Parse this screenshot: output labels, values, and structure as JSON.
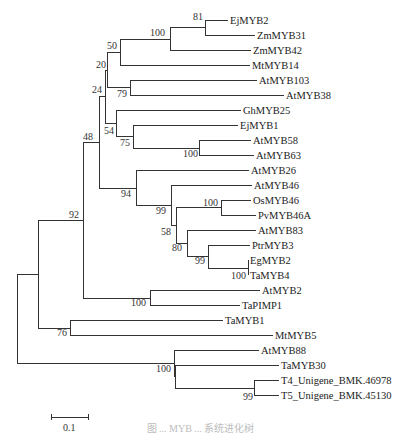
{
  "tree": {
    "type": "phylogenetic-tree",
    "leaves": [
      {
        "label": "EjMYB2",
        "x": 230,
        "y": 20
      },
      {
        "label": "ZmMYB31",
        "x": 257,
        "y": 35
      },
      {
        "label": "ZmMYB42",
        "x": 253,
        "y": 50
      },
      {
        "label": "MtMYB14",
        "x": 252,
        "y": 65
      },
      {
        "label": "AtMYB103",
        "x": 259,
        "y": 80
      },
      {
        "label": "AtMYB38",
        "x": 286,
        "y": 95
      },
      {
        "label": "GhMYB25",
        "x": 243,
        "y": 110
      },
      {
        "label": "EjMYB1",
        "x": 240,
        "y": 125
      },
      {
        "label": "AtMYB58",
        "x": 253,
        "y": 140
      },
      {
        "label": "AtMYB63",
        "x": 256,
        "y": 155
      },
      {
        "label": "AtMYB26",
        "x": 251,
        "y": 170
      },
      {
        "label": "AtMYB46",
        "x": 254,
        "y": 185
      },
      {
        "label": "OsMYB46",
        "x": 253,
        "y": 200
      },
      {
        "label": "PvMYB46A",
        "x": 258,
        "y": 215
      },
      {
        "label": "AtMYB83",
        "x": 258,
        "y": 230
      },
      {
        "label": "PtrMYB3",
        "x": 252,
        "y": 245
      },
      {
        "label": "EgMYB2",
        "x": 250,
        "y": 260
      },
      {
        "label": "TaMYB4",
        "x": 250,
        "y": 275
      },
      {
        "label": "AtMYB2",
        "x": 262,
        "y": 290
      },
      {
        "label": "TaPIMP1",
        "x": 242,
        "y": 305
      },
      {
        "label": "TaMYB1",
        "x": 225,
        "y": 320
      },
      {
        "label": "MtMYB5",
        "x": 275,
        "y": 335
      },
      {
        "label": "AtMYB88",
        "x": 261,
        "y": 350
      },
      {
        "label": "TaMYB30",
        "x": 281,
        "y": 365
      },
      {
        "label": "T4_Unigene_BMK.46978",
        "x": 281,
        "y": 380
      },
      {
        "label": "T5_Unigene_BMK.45130",
        "x": 281,
        "y": 395
      }
    ],
    "bootstrap": [
      {
        "value": "81",
        "x": 205,
        "y": 24
      },
      {
        "value": "100",
        "x": 167,
        "y": 36
      },
      {
        "value": "50",
        "x": 107,
        "y": 49
      },
      {
        "value": "20",
        "x": 96,
        "y": 67
      },
      {
        "value": "79",
        "x": 117,
        "y": 97
      },
      {
        "value": "24",
        "x": 92,
        "y": 94
      },
      {
        "value": "54",
        "x": 104,
        "y": 134
      },
      {
        "value": "75",
        "x": 120,
        "y": 146
      },
      {
        "value": "100",
        "x": 180,
        "y": 157
      },
      {
        "value": "48",
        "x": 82,
        "y": 141
      },
      {
        "value": "94",
        "x": 124,
        "y": 197
      },
      {
        "value": "99",
        "x": 161,
        "y": 214
      },
      {
        "value": "100",
        "x": 193,
        "y": 205
      },
      {
        "value": "58",
        "x": 164,
        "y": 235
      },
      {
        "value": "80",
        "x": 171,
        "y": 251
      },
      {
        "value": "99",
        "x": 196,
        "y": 264
      },
      {
        "value": "100",
        "x": 236,
        "y": 279
      },
      {
        "value": "92",
        "x": 78,
        "y": 217
      },
      {
        "value": "100",
        "x": 144,
        "y": 306
      },
      {
        "value": "76",
        "x": 61,
        "y": 336
      },
      {
        "value": "100",
        "x": 173,
        "y": 372
      },
      {
        "value": "99",
        "x": 247,
        "y": 399
      }
    ],
    "scale_bar": {
      "label": "0.1",
      "x1": 51,
      "x2": 88,
      "y": 417
    }
  },
  "caption": "图 ... MYB ... 系统进化树"
}
